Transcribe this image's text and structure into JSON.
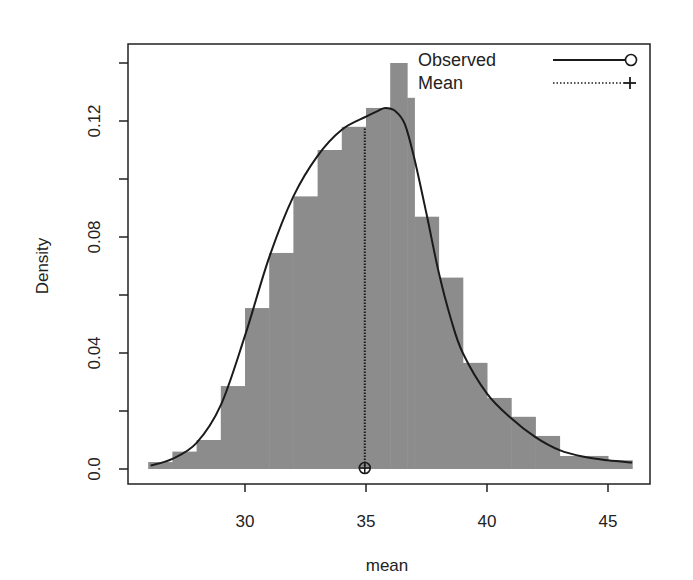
{
  "chart_data": {
    "type": "bar",
    "subtype": "histogram-with-density",
    "title": "",
    "xlabel": "mean",
    "ylabel": "Density",
    "xlim": [
      25.3,
      47.8
    ],
    "ylim": [
      -0.0055,
      0.146
    ],
    "x_ticks": [
      30,
      35,
      40,
      45
    ],
    "x_tick_labels": [
      "30",
      "35",
      "40",
      "45"
    ],
    "y_ticks": [
      0.0,
      0.02,
      0.04,
      0.06,
      0.08,
      0.1,
      0.12,
      0.14
    ],
    "y_tick_labels": [
      "0.0",
      "",
      "0.04",
      "",
      "0.08",
      "",
      "0.12",
      ""
    ],
    "grid": false,
    "legend_position": "top-right",
    "bins": [
      {
        "x0": 26,
        "x1": 27,
        "density": 0.0024
      },
      {
        "x0": 27,
        "x1": 28,
        "density": 0.006
      },
      {
        "x0": 28,
        "x1": 29,
        "density": 0.01
      },
      {
        "x0": 29,
        "x1": 30,
        "density": 0.0286
      },
      {
        "x0": 30,
        "x1": 31,
        "density": 0.0555
      },
      {
        "x0": 31,
        "x1": 32,
        "density": 0.0745
      },
      {
        "x0": 32,
        "x1": 33,
        "density": 0.094
      },
      {
        "x0": 33,
        "x1": 34,
        "density": 0.11
      },
      {
        "x0": 34,
        "x1": 35,
        "density": 0.118
      },
      {
        "x0": 35,
        "x1": 36,
        "density": 0.1245
      },
      {
        "x0": 36,
        "x1": 36.7,
        "density": 0.14
      },
      {
        "x0": 36.7,
        "x1": 37,
        "density": 0.128
      },
      {
        "x0": 37,
        "x1": 38,
        "density": 0.087
      },
      {
        "x0": 38,
        "x1": 39,
        "density": 0.066
      },
      {
        "x0": 39,
        "x1": 40,
        "density": 0.0366
      },
      {
        "x0": 40,
        "x1": 41,
        "density": 0.0245
      },
      {
        "x0": 41,
        "x1": 42,
        "density": 0.018
      },
      {
        "x0": 42,
        "x1": 43,
        "density": 0.0114
      },
      {
        "x0": 43,
        "x1": 45,
        "density": 0.0045
      },
      {
        "x0": 45,
        "x1": 46,
        "density": 0.003
      }
    ],
    "series": [
      {
        "name": "Observed",
        "style": "solid",
        "marker": "circle",
        "x": [
          26.1,
          27,
          28,
          29,
          30,
          31,
          32,
          33,
          34,
          35,
          35.5,
          35.8,
          36.2,
          36.6,
          37,
          37.5,
          38,
          38.5,
          39,
          40,
          41,
          42,
          43,
          44,
          45,
          46
        ],
        "y": [
          0.0012,
          0.0035,
          0.009,
          0.022,
          0.046,
          0.073,
          0.094,
          0.108,
          0.117,
          0.1215,
          0.1235,
          0.1245,
          0.1235,
          0.119,
          0.107,
          0.088,
          0.068,
          0.052,
          0.04,
          0.026,
          0.0175,
          0.011,
          0.0065,
          0.0042,
          0.003,
          0.0022
        ]
      },
      {
        "name": "Mean",
        "style": "dotted",
        "marker": "plus",
        "x": [
          34.95,
          34.95
        ],
        "y": [
          0.0,
          0.1175
        ]
      }
    ],
    "annotations": [
      {
        "type": "marker",
        "shape": "circle-plus",
        "x": 34.95,
        "y": 0.0
      }
    ]
  },
  "legend": {
    "items": [
      {
        "label": "Observed",
        "line": "solid",
        "marker": "circle"
      },
      {
        "label": "Mean",
        "line": "dotted",
        "marker": "plus"
      }
    ]
  },
  "colors": {
    "bar_fill": "#8c8c8c",
    "line": "#1a1a1a",
    "frame": "#222222",
    "background": "#ffffff"
  }
}
